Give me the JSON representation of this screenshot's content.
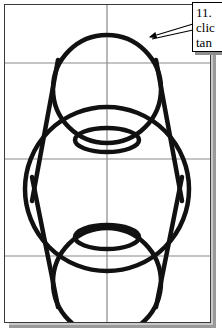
{
  "document": {
    "title": "Tangent construction drawing",
    "background_color": "#ffffff",
    "sheet_color": "#ffffff",
    "sheet_border_color": "#3a3a3a",
    "shadow_color": "#9a9a9a"
  },
  "canvas": {
    "width": 205,
    "height": 317,
    "grid": {
      "color": "#8a8a8a",
      "line_width": 1,
      "vertical_lines_x": [
        102
      ],
      "horizontal_lines_y": [
        58,
        154,
        251
      ]
    },
    "geometry": {
      "stroke_color": "#111111",
      "stroke_width": 4.5,
      "circles": [
        {
          "name": "top-circle",
          "cx": 102,
          "cy": 84,
          "r": 54
        },
        {
          "name": "middle-circle",
          "cx": 102,
          "cy": 184,
          "r": 82
        },
        {
          "name": "bottom-circle",
          "cx": 102,
          "cy": 277,
          "r": 54
        }
      ],
      "ellipses": [
        {
          "name": "upper-connector-ellipse",
          "cx": 102,
          "cy": 135,
          "rx": 32,
          "ry": 12
        },
        {
          "name": "lower-connector-ellipse",
          "cx": 102,
          "cy": 232,
          "rx": 32,
          "ry": 12
        }
      ],
      "tangent_lines": [
        {
          "name": "tangent-upper-left",
          "x1": 52,
          "y1": 58,
          "x2": 26,
          "y2": 194
        },
        {
          "name": "tangent-upper-right",
          "x1": 152,
          "y1": 58,
          "x2": 178,
          "y2": 194
        },
        {
          "name": "tangent-lower-left",
          "x1": 26,
          "y1": 176,
          "x2": 52,
          "y2": 300
        },
        {
          "name": "tangent-lower-right",
          "x1": 178,
          "y1": 176,
          "x2": 152,
          "y2": 300
        }
      ]
    }
  },
  "callout": {
    "border_color": "#000000",
    "background_color": "#ffffff",
    "shadow_color": "#8e8e8e",
    "lines": [
      "11.",
      "clic",
      "tan"
    ],
    "leader": {
      "name": "leader-arrow",
      "from_x": 193,
      "from_y": 26,
      "to_x": 146,
      "to_y": 38,
      "color": "#000000"
    }
  }
}
